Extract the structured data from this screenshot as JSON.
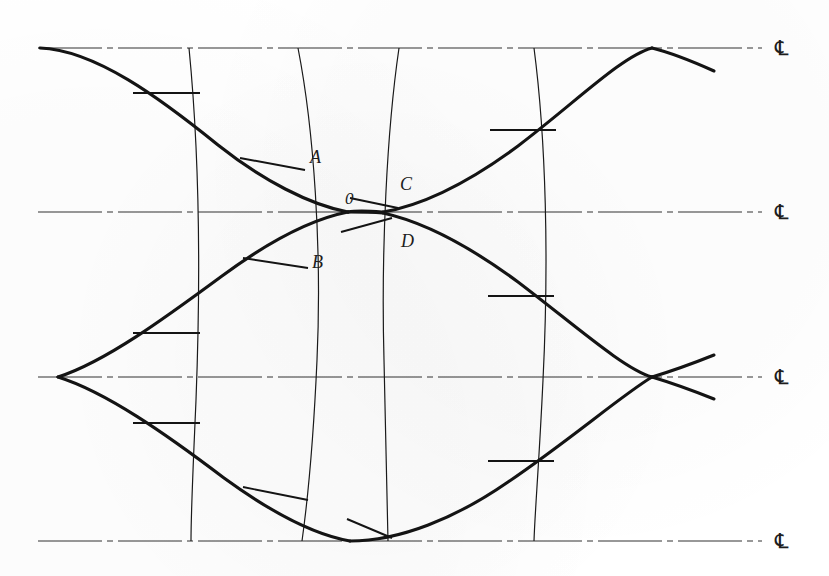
{
  "figure": {
    "kind": "engineering-line-diagram",
    "background_color": "#ffffff",
    "line_color": "#141414",
    "centerline_color": "#333333",
    "width": 829,
    "height": 576
  },
  "centerlines": [
    {
      "id": "cl-top",
      "label": "℄",
      "y": 48,
      "x_start": 38,
      "x_end": 762
    },
    {
      "id": "cl-second",
      "label": "℄",
      "y": 212,
      "x_start": 38,
      "x_end": 762
    },
    {
      "id": "cl-third",
      "label": "℄",
      "y": 377,
      "x_start": 38,
      "x_end": 762
    },
    {
      "id": "cl-bottom",
      "label": "℄",
      "y": 541,
      "x_start": 38,
      "x_end": 762
    }
  ],
  "centerline_label_x": 775,
  "point_labels": [
    {
      "name": "A",
      "text": "A",
      "x": 310,
      "y": 163
    },
    {
      "name": "B",
      "text": "B",
      "x": 312,
      "y": 268
    },
    {
      "name": "C",
      "text": "C",
      "x": 400,
      "y": 190
    },
    {
      "name": "D",
      "text": "D",
      "x": 401,
      "y": 247
    },
    {
      "name": "zero",
      "text": "0",
      "x": 345,
      "y": 204
    }
  ],
  "vertical_curves": [
    {
      "name": "vcurve-1",
      "path": "M 189 48 C 199 150, 201 270, 196 400 C 193 470, 191 510, 191 541"
    },
    {
      "name": "vcurve-2",
      "path": "M 298 48 C 314 130, 322 250, 317 360 C 313 450, 307 505, 302 541"
    },
    {
      "name": "vcurve-3",
      "path": "M 399 48 C 387 130, 381 250, 384 360 C 386 450, 387 505, 388 541"
    },
    {
      "name": "vcurve-4",
      "path": "M 534 48 C 546 140, 549 260, 543 380 C 539 465, 535 510, 534 541"
    }
  ],
  "thick_curves": [
    {
      "name": "curve-upper-left-descending",
      "path": "M 40 48 C 95 50, 160 98, 218 145 C 262 180, 310 205, 348 212"
    },
    {
      "name": "curve-lower-left-ascending",
      "path": "M 348 212 C 312 219, 268 242, 222 276 C 165 318, 105 362, 58 377"
    },
    {
      "name": "curve-mid-left-to-cusp",
      "path": "M 58 377 C 106 392, 166 434, 224 478 C 268 510, 310 534, 350 541"
    },
    {
      "name": "curve-right-upper-ascend",
      "path": "M 383 212 C 424 205, 472 180, 518 146 C 576 102, 622 56, 652 48"
    },
    {
      "name": "curve-right-upper-tail",
      "path": "M 652 48 C 672 53, 694 62, 714 71"
    },
    {
      "name": "curve-right-lower-descend",
      "path": "M 383 213 C 424 222, 472 248, 518 282 C 576 326, 624 369, 652 377"
    },
    {
      "name": "curve-right-cusp-tail-up",
      "path": "M 652 377 C 672 371, 694 363, 714 355"
    },
    {
      "name": "curve-right-cusp-tail-down",
      "path": "M 652 377 C 672 383, 694 391, 714 399"
    },
    {
      "name": "curve-bottom-ascend-right",
      "path": "M 350 541 C 400 541, 456 518, 508 482 C 570 440, 622 395, 652 377"
    },
    {
      "name": "curve-center-apex-upper",
      "path": "M 348 212 C 358 210, 370 211, 383 212"
    },
    {
      "name": "curve-center-apex-lower",
      "path": "M 348 212 C 358 212, 370 212, 383 213"
    }
  ],
  "ticks": [
    {
      "name": "tick-top-left",
      "x1": 133,
      "y1": 93,
      "x2": 200,
      "y2": 93
    },
    {
      "name": "tick-A",
      "x1": 240,
      "y1": 158,
      "x2": 305,
      "y2": 170
    },
    {
      "name": "tick-B",
      "x1": 243,
      "y1": 258,
      "x2": 308,
      "y2": 268
    },
    {
      "name": "tick-left-mid",
      "x1": 133,
      "y1": 333,
      "x2": 200,
      "y2": 333
    },
    {
      "name": "tick-left-lower",
      "x1": 133,
      "y1": 423,
      "x2": 200,
      "y2": 423
    },
    {
      "name": "tick-bottom-left",
      "x1": 243,
      "y1": 487,
      "x2": 308,
      "y2": 500
    },
    {
      "name": "tick-bottom-mid",
      "x1": 347,
      "y1": 519,
      "x2": 392,
      "y2": 538
    },
    {
      "name": "tick-C-apex",
      "x1": 350,
      "y1": 198,
      "x2": 398,
      "y2": 208
    },
    {
      "name": "tick-D-apex",
      "x1": 341,
      "y1": 232,
      "x2": 392,
      "y2": 218
    },
    {
      "name": "tick-right-top",
      "x1": 490,
      "y1": 130,
      "x2": 556,
      "y2": 130
    },
    {
      "name": "tick-right-mid",
      "x1": 488,
      "y1": 296,
      "x2": 554,
      "y2": 296
    },
    {
      "name": "tick-right-lower",
      "x1": 488,
      "y1": 461,
      "x2": 554,
      "y2": 461
    }
  ]
}
